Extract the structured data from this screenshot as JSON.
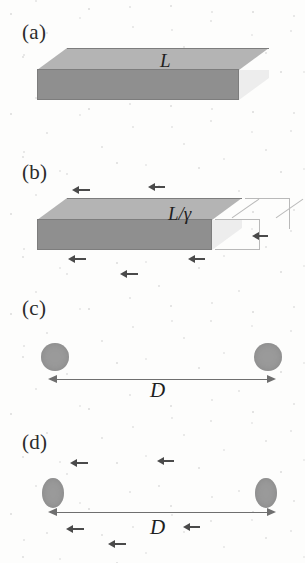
{
  "figure": {
    "type": "physics-diagram",
    "topic": "Lorentz length contraction",
    "width": 305,
    "height": 563,
    "background_color": "#fdfdfc",
    "panels": [
      {
        "id": "a",
        "label": "(a)",
        "label_x": 22,
        "label_y": 20,
        "object": "rectangular-slab-3d",
        "state": "rest",
        "length_label": "L",
        "length_label_x": 160,
        "length_label_y": 50,
        "motion_arrows": []
      },
      {
        "id": "b",
        "label": "(b)",
        "label_x": 22,
        "label_y": 160,
        "object": "rectangular-slab-3d",
        "state": "moving-contracted",
        "length_label": "L/γ",
        "length_label_x": 168,
        "length_label_y": 203,
        "ghost_outline": "original-rest-length",
        "motion_arrows": [
          {
            "x": 72,
            "y": 189,
            "length": 14
          },
          {
            "x": 148,
            "y": 186,
            "length": 13
          },
          {
            "x": 68,
            "y": 258,
            "length": 14
          },
          {
            "x": 120,
            "y": 273,
            "length": 14
          },
          {
            "x": 188,
            "y": 258,
            "length": 13
          },
          {
            "x": 252,
            "y": 235,
            "length": 12
          }
        ]
      },
      {
        "id": "c",
        "label": "(c)",
        "label_x": 22,
        "label_y": 296,
        "object": "two-spheres",
        "state": "rest",
        "separation_label": "D",
        "separation_label_x": 150,
        "separation_label_y": 378,
        "sphere_shape": "circle",
        "left_sphere": {
          "cx": 55,
          "cy": 357,
          "rx": 14,
          "ry": 14
        },
        "right_sphere": {
          "cx": 268,
          "cy": 357,
          "rx": 14,
          "ry": 14
        },
        "measure_arrow": {
          "x1": 48,
          "x2": 276,
          "y": 375
        },
        "motion_arrows": []
      },
      {
        "id": "d",
        "label": "(d)",
        "label_x": 22,
        "label_y": 430,
        "object": "two-spheres",
        "state": "moving-contracted",
        "separation_label": "D",
        "separation_label_x": 150,
        "separation_label_y": 515,
        "sphere_shape": "ellipse",
        "left_sphere": {
          "cx": 53,
          "cy": 493,
          "rx": 11,
          "ry": 15
        },
        "right_sphere": {
          "cx": 266,
          "cy": 493,
          "rx": 11,
          "ry": 15
        },
        "measure_arrow": {
          "x1": 48,
          "x2": 276,
          "y": 512
        },
        "motion_arrows": [
          {
            "x": 70,
            "y": 462,
            "length": 14
          },
          {
            "x": 157,
            "y": 460,
            "length": 13
          },
          {
            "x": 66,
            "y": 528,
            "length": 14
          },
          {
            "x": 183,
            "y": 526,
            "length": 13
          },
          {
            "x": 108,
            "y": 543,
            "length": 14
          }
        ]
      }
    ],
    "colors": {
      "slab_top_face": "#b4b4b4",
      "slab_front_face": "#8f8f8f",
      "slab_side_face": "#ededed",
      "slab_edge": "#7d7d7d",
      "ghost_outline": "#b9b9b9",
      "sphere_fill": "#9a9a9a",
      "measure_arrow": "#6f6f6f",
      "motion_arrow": "#4a4a4a",
      "label_text": "#2b2b2b",
      "math_text": "#1f1f1f"
    }
  }
}
